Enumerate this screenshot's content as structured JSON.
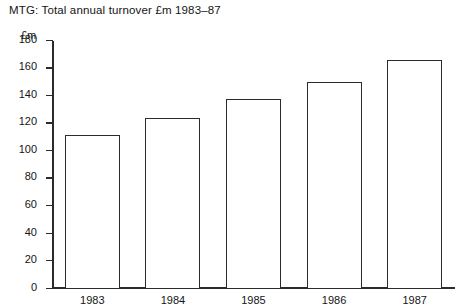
{
  "chart_data": {
    "type": "bar",
    "title": "MTG: Total annual turnover £m 1983–87",
    "xlabel": "",
    "ylabel": "£m",
    "categories": [
      "1983",
      "1984",
      "1985",
      "1986",
      "1987"
    ],
    "values": [
      112,
      124,
      138,
      150,
      166
    ],
    "ylim": [
      0,
      180
    ],
    "y_ticks": [
      0,
      20,
      40,
      60,
      80,
      100,
      120,
      140,
      160,
      180
    ],
    "y_tick_labels": [
      "0",
      "20",
      "40",
      "60",
      "80",
      "100",
      "120",
      "140",
      "160",
      "180"
    ],
    "grid": false,
    "legend": false,
    "legend_position": "none",
    "series": [
      {
        "name": "Total annual turnover",
        "values": [
          112,
          124,
          138,
          150,
          166
        ]
      }
    ],
    "bar_style": {
      "fill": "#ffffff",
      "outline": "#2b2b2b"
    }
  }
}
